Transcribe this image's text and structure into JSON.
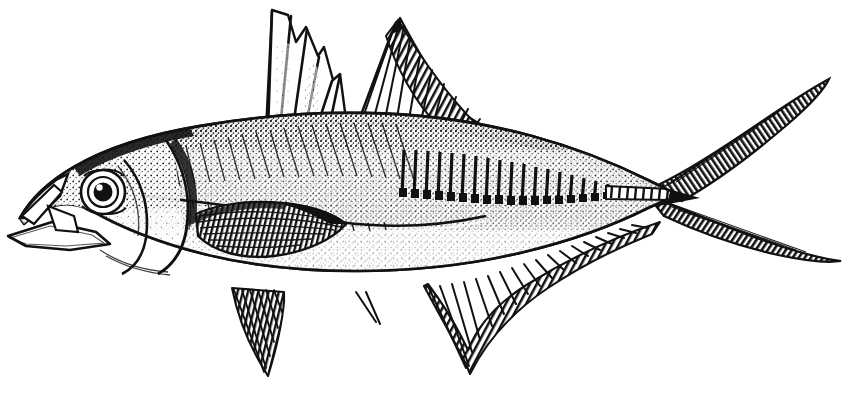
{
  "image": {
    "kind": "scientific-line-illustration",
    "technique": "pen-and-ink engraving / stipple-and-hatch halftone",
    "subject": "horse mackerel (scad) fish, lateral view facing left",
    "width": 850,
    "height": 395,
    "background_color": "#ffffff",
    "ink_color": "#111111",
    "has_text": false,
    "caption": ""
  },
  "palette": {
    "ink": "#111111",
    "ink_soft": "#2a2a2a",
    "ink_mid": "#555555",
    "ink_light": "#8c8c8c",
    "paper": "#ffffff"
  },
  "anatomy": {
    "parts": [
      {
        "id": "body",
        "label": "Body",
        "note": "elongate fusiform, deepest just behind the head"
      },
      {
        "id": "head",
        "label": "Head",
        "note": "large, roughly one quarter of total length"
      },
      {
        "id": "eye",
        "label": "Eye",
        "note": "large round eye with dark pupil and white highlight"
      },
      {
        "id": "mouth",
        "label": "Mouth",
        "note": "open, oblique, lower jaw projecting"
      },
      {
        "id": "operculum",
        "label": "Gill cover",
        "note": "curved posterior margin with dark edge"
      },
      {
        "id": "first-dorsal-fin",
        "label": "First dorsal fin",
        "note": "short triangular spiny fin, about 8 spines"
      },
      {
        "id": "second-dorsal-fin",
        "label": "Second dorsal fin",
        "note": "long soft-rayed fin, tall anterior lobe tapering to tail"
      },
      {
        "id": "pectoral-fin",
        "label": "Pectoral fin",
        "note": "long falcate fin, sickle shaped, reaching past mid-body"
      },
      {
        "id": "pelvic-fin",
        "label": "Pelvic fin",
        "note": "small, pointed, under the pectoral base"
      },
      {
        "id": "anal-fin",
        "label": "Anal fin",
        "note": "long soft-rayed fin mirroring the second dorsal"
      },
      {
        "id": "anal-spines",
        "label": "Detached anal spines",
        "note": "two small free spines ahead of the anal fin"
      },
      {
        "id": "lateral-line",
        "label": "Lateral line",
        "note": "arched in front, straight behind, bearing bony scutes"
      },
      {
        "id": "scutes",
        "label": "Caudal scutes",
        "note": "row of enlarged keeled scales on the caudal peduncle"
      },
      {
        "id": "caudal-fin",
        "label": "Caudal fin",
        "note": "deeply forked, long slender lobes"
      },
      {
        "id": "caudal-peduncle",
        "label": "Caudal peduncle",
        "note": "very narrow, strongly keeled"
      }
    ]
  },
  "chart_data": {
    "type": "line",
    "title": "",
    "xlabel": "",
    "ylabel": "",
    "xlim": [
      0,
      850
    ],
    "ylim": [
      0,
      395
    ],
    "grid": false,
    "legend": "none",
    "series": [
      {
        "name": "dorsal-contour",
        "values": [
          [
            18,
            215
          ],
          [
            34,
            196
          ],
          [
            58,
            178
          ],
          [
            92,
            162
          ],
          [
            132,
            150
          ],
          [
            180,
            140
          ],
          [
            232,
            131
          ],
          [
            280,
            124
          ],
          [
            330,
            120
          ],
          [
            380,
            120
          ],
          [
            430,
            123
          ],
          [
            480,
            130
          ],
          [
            530,
            140
          ],
          [
            580,
            152
          ],
          [
            620,
            163
          ],
          [
            650,
            172
          ],
          [
            672,
            180
          ]
        ]
      },
      {
        "name": "ventral-contour",
        "values": [
          [
            18,
            222
          ],
          [
            46,
            244
          ],
          [
            86,
            262
          ],
          [
            130,
            278
          ],
          [
            180,
            288
          ],
          [
            236,
            295
          ],
          [
            292,
            297
          ],
          [
            350,
            293
          ],
          [
            406,
            284
          ],
          [
            456,
            272
          ],
          [
            512,
            255
          ],
          [
            560,
            238
          ],
          [
            604,
            221
          ],
          [
            640,
            206
          ],
          [
            666,
            196
          ]
        ]
      },
      {
        "name": "lateral-line",
        "values": [
          [
            140,
            198
          ],
          [
            190,
            200
          ],
          [
            240,
            206
          ],
          [
            290,
            214
          ],
          [
            340,
            222
          ],
          [
            390,
            226
          ],
          [
            440,
            222
          ],
          [
            490,
            214
          ],
          [
            540,
            205
          ],
          [
            586,
            198
          ],
          [
            626,
            192
          ],
          [
            660,
            189
          ]
        ]
      }
    ]
  },
  "geometry": {
    "body_outline": "M 20 219 C 34 196 58 177 92 161 C 140 139 198 128 262 122 C 336 116 412 120 478 134 C 536 147 592 168 648 190 L 672 199 L 672 182 L 648 174 C 596 153 540 135 480 124 C 412 112 336 107 262 113 C 196 119 140 131 92 153 C 56 170 32 191 20 211 Z",
    "first_dorsal_spines": [
      {
        "x1": 268,
        "y1": 128,
        "x2": 271,
        "y2": 9
      },
      {
        "x1": 281,
        "y1": 126,
        "x2": 292,
        "y2": 16
      },
      {
        "x1": 294,
        "y1": 124,
        "x2": 308,
        "y2": 28
      },
      {
        "x1": 307,
        "y1": 123,
        "x2": 320,
        "y2": 48
      },
      {
        "x1": 320,
        "y1": 122,
        "x2": 331,
        "y2": 68
      },
      {
        "x1": 332,
        "y1": 121,
        "x2": 338,
        "y2": 86
      }
    ],
    "second_dorsal_ray_count": 30,
    "anal_ray_count": 26,
    "scute_count": 22,
    "eye": {
      "cx": 103,
      "cy": 192,
      "r_outer": 21,
      "r_iris": 15,
      "r_pupil": 8,
      "highlight": {
        "cx": 99,
        "cy": 187,
        "r": 3
      }
    },
    "caudal_fin": {
      "upper_lobe": "M 668 186 L 700 168 L 760 122 L 812 88 L 828 80 L 818 96 L 778 130 L 724 172 L 690 196 Z",
      "lower_lobe": "M 668 198 L 704 212 L 762 240 L 820 258 L 840 262 L 824 262 L 770 252 L 712 230 L 676 212 Z"
    }
  }
}
